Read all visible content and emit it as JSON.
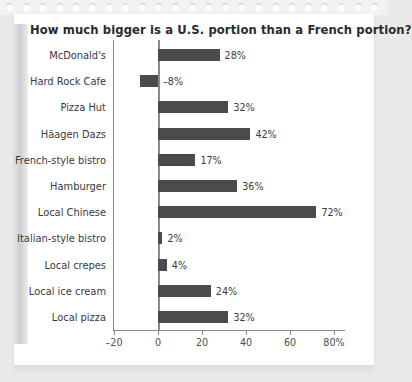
{
  "chart_data": {
    "type": "bar",
    "orientation": "horizontal",
    "title": "How much bigger is a U.S. portion than a French portion?",
    "xlabel": "",
    "ylabel": "",
    "xlim": [
      -20,
      80
    ],
    "grid": false,
    "legend": null,
    "categories": [
      "McDonald's",
      "Hard Rock Cafe",
      "Pizza Hut",
      "Häagen Dazs",
      "French-style bistro",
      "Hamburger",
      "Local Chinese",
      "Italian-style bistro",
      "Local crepes",
      "Local ice cream",
      "Local pizza"
    ],
    "values": [
      28,
      -8,
      32,
      42,
      17,
      36,
      72,
      2,
      4,
      24,
      32
    ],
    "data_labels": [
      "28%",
      "–8%",
      "32%",
      "42%",
      "17%",
      "36%",
      "72%",
      "2%",
      "4%",
      "24%",
      "32%"
    ],
    "xticks": [
      -20,
      0,
      20,
      40,
      60,
      80
    ],
    "xtick_labels": [
      "–20",
      "0",
      "20",
      "40",
      "60",
      "80%"
    ],
    "bar_color": "#4b4b4b",
    "axis_color": "#8a8a8a",
    "text_color": "#3a3a3a",
    "page_color": "#ffffff",
    "background_color": "#e9e9e9"
  },
  "notebook": {
    "hole_count": 23
  }
}
